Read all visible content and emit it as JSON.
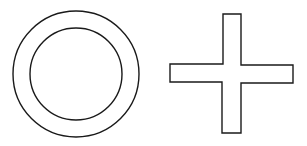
{
  "shapes": [
    {
      "kind": "annulus",
      "label": "ring"
    },
    {
      "kind": "cross",
      "label": "plus-sign"
    }
  ],
  "colors": {
    "stroke": "#1a1a1a",
    "fill": "#ffffff",
    "background": "#ffffff"
  }
}
